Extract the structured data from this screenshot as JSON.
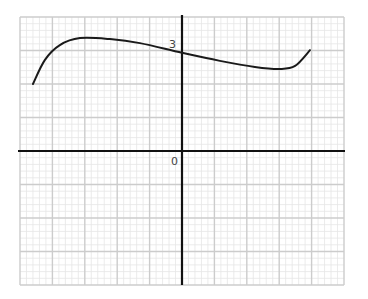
{
  "chart_data": {
    "type": "line",
    "title": "",
    "xlabel": "",
    "ylabel": "",
    "xlim": [
      -5,
      5
    ],
    "ylim": [
      -4,
      4
    ],
    "grid": true,
    "grid_major_step": 1,
    "grid_minor_step": 0.2,
    "tick_labels": [
      {
        "text": "3",
        "axis": "y",
        "value": 3
      },
      {
        "text": "0",
        "axis": "origin",
        "value": 0
      }
    ],
    "series": [
      {
        "name": "f(x)",
        "x": [
          -4.6,
          -4.23,
          -3.77,
          -3.15,
          -2.22,
          -1.3,
          0,
          1.17,
          2.25,
          3.02,
          3.49,
          3.95
        ],
        "y": [
          2.0,
          2.72,
          3.16,
          3.37,
          3.34,
          3.22,
          2.93,
          2.69,
          2.51,
          2.45,
          2.54,
          3.01
        ]
      }
    ],
    "colors": {
      "curve": "#1a1a1a",
      "axis": "#111111",
      "grid_major": "#cccccc",
      "grid_minor": "#e6e6e6"
    }
  }
}
